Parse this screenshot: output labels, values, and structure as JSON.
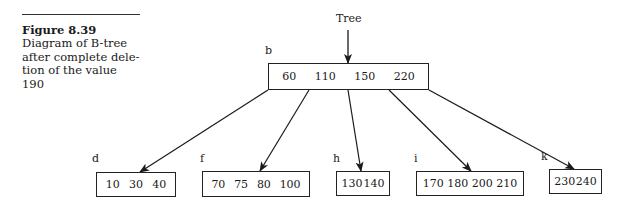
{
  "caption": {
    "figure": "Figure 8.39",
    "lines": [
      "Diagram of B-tree",
      "after complete dele-",
      "tion of the value 190"
    ]
  },
  "diagram": {
    "entry_label": "Tree",
    "root": {
      "label": "b",
      "keys": [
        "60",
        "110",
        "150",
        "220"
      ]
    },
    "children": [
      {
        "label": "d",
        "keys": [
          "10",
          "30",
          "40"
        ]
      },
      {
        "label": "f",
        "keys": [
          "70",
          "75",
          "80",
          "100"
        ]
      },
      {
        "label": "h",
        "keys": [
          "130",
          "140"
        ]
      },
      {
        "label": "i",
        "keys": [
          "170",
          "180",
          "200",
          "210"
        ]
      },
      {
        "label": "k",
        "keys": [
          "230",
          "240"
        ]
      }
    ]
  }
}
